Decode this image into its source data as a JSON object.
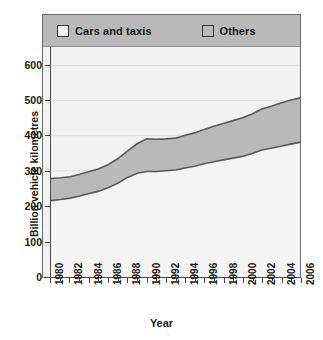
{
  "chart_data": {
    "type": "area",
    "stacked": true,
    "title": "",
    "xlabel": "Year",
    "ylabel": "Billion vehicle kilometres",
    "xlim": [
      1980,
      2006
    ],
    "ylim": [
      0,
      650
    ],
    "yticks": [
      0,
      100,
      200,
      300,
      400,
      500,
      600
    ],
    "xticks": [
      1980,
      1982,
      1984,
      1986,
      1988,
      1990,
      1992,
      1994,
      1996,
      1998,
      2000,
      2002,
      2004,
      2006
    ],
    "xtick_labels": [
      "1980",
      "1982",
      "1984",
      "1986",
      "1988",
      "1990",
      "1992",
      "1994",
      "1996",
      "1998",
      "2000",
      "2002",
      "2004",
      "2006"
    ],
    "minor_xticks": [
      1981,
      1983,
      1985,
      1987,
      1989,
      1991,
      1993,
      1995,
      1997,
      1999,
      2001,
      2003,
      2005
    ],
    "grid": "horizontal",
    "legend_position": "top",
    "x": [
      1980,
      1981,
      1982,
      1983,
      1984,
      1985,
      1986,
      1987,
      1988,
      1989,
      1990,
      1991,
      1992,
      1993,
      1994,
      1995,
      1996,
      1997,
      1998,
      1999,
      2000,
      2001,
      2002,
      2003,
      2004,
      2005,
      2006
    ],
    "series": [
      {
        "name": "Cars and taxis",
        "color": "#f4f4f4",
        "values": [
          215,
          218,
          222,
          228,
          235,
          242,
          252,
          265,
          281,
          293,
          298,
          298,
          300,
          302,
          308,
          313,
          320,
          326,
          331,
          336,
          341,
          349,
          359,
          364,
          370,
          376,
          381
        ]
      },
      {
        "name": "Others",
        "color": "#b9b9b9",
        "values": [
          63,
          62,
          61,
          62,
          63,
          64,
          66,
          70,
          76,
          84,
          93,
          92,
          91,
          91,
          93,
          95,
          98,
          101,
          104,
          107,
          110,
          113,
          117,
          120,
          123,
          125,
          127
        ]
      }
    ],
    "totals": [
      278,
      280,
      283,
      290,
      298,
      306,
      318,
      335,
      357,
      377,
      391,
      390,
      391,
      393,
      401,
      408,
      418,
      427,
      435,
      443,
      451,
      462,
      476,
      484,
      493,
      501,
      508
    ]
  },
  "legend": {
    "items": [
      {
        "label": "Cars and taxis",
        "swatch": "cars-swatch",
        "color": "#f4f4f4"
      },
      {
        "label": "Others",
        "swatch": "others-swatch",
        "color": "#b9b9b9"
      }
    ]
  },
  "axes": {
    "y_title": "Billion vehicle kilometres",
    "x_title": "Year"
  },
  "colors": {
    "frame": "#6b6b6b",
    "legend_band": "#b9b9b9",
    "plot_bg": "#f2f2f2",
    "band_cars": "#f4f4f4",
    "band_others": "#b9b9b9",
    "band_outline": "#5a5a5a",
    "gridline": "#d8d8d8",
    "axis": "#4a4a4a",
    "text": "#1a1a1a"
  }
}
